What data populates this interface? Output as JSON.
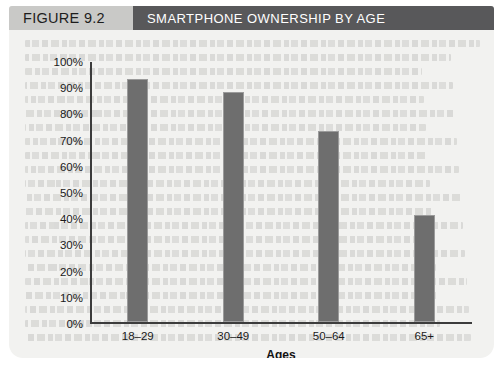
{
  "figure": {
    "number_label": "FIGURE 9.2",
    "title": "SMARTPHONE OWNERSHIP BY AGE",
    "number_band_color": "#c9c9c7",
    "title_band_color": "#58585a",
    "page_color": "#f2f2f0"
  },
  "chart_data": {
    "type": "bar",
    "title": "SMARTPHONE OWNERSHIP BY AGE",
    "categories": [
      "18–29",
      "30–49",
      "50–64",
      "65+"
    ],
    "values": [
      93,
      88,
      73,
      41
    ],
    "xlabel": "Ages",
    "ylabel": "",
    "ylim": [
      0,
      100
    ],
    "ytick_labels": [
      "100%",
      "90%",
      "80%",
      "70%",
      "60%",
      "50%",
      "40%",
      "30%",
      "20%",
      "10%",
      "0%"
    ],
    "ytick_values": [
      100,
      90,
      80,
      70,
      60,
      50,
      40,
      30,
      20,
      10,
      0
    ],
    "grid": false,
    "legend": null,
    "bar_color": "#6e6e6e",
    "axis_color": "#3c3c3c"
  }
}
